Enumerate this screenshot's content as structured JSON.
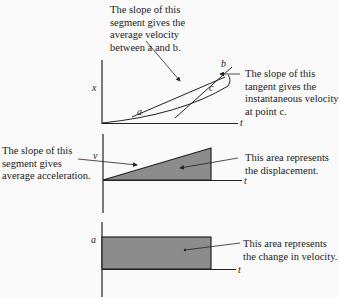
{
  "graphs": {
    "position": {
      "y_label": "x",
      "x_label": "t",
      "points": {
        "a": "a",
        "b": "b",
        "c": "c"
      },
      "secant_note": [
        "The slope of this",
        "segment gives the",
        "average velocity",
        "between a and b."
      ],
      "tangent_note": [
        "The slope of this",
        "tangent gives the",
        "instantaneous velocity",
        "at point c."
      ]
    },
    "velocity": {
      "y_label": "v",
      "x_label": "t",
      "slope_note": [
        "The slope of this",
        "segment gives",
        "average acceleration."
      ],
      "area_note": [
        "This area represents",
        "the displacement."
      ]
    },
    "acceleration": {
      "y_label": "a",
      "x_label": "t",
      "area_note": [
        "This area represents",
        "the change in velocity."
      ]
    }
  },
  "colors": {
    "fill": "#8c8c8c",
    "line": "#222222"
  }
}
